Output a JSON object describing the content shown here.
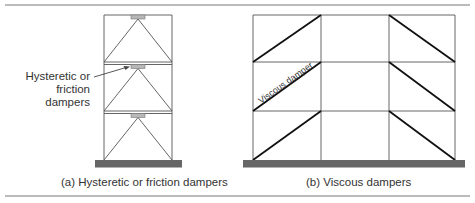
{
  "panels": [
    {
      "id": "a",
      "caption": "(a) Hysteretic or friction dampers",
      "annotation_line1": "Hysteretic or",
      "annotation_line2": "friction dampers",
      "stories": 3,
      "bays": 1,
      "bracing": "chevron",
      "damper_location": "top of chevron brace at each floor beam"
    },
    {
      "id": "b",
      "caption": "(b) Viscous dampers",
      "annotation": "Viscous damper",
      "stories": 3,
      "bays": 3,
      "bracing": "diagonal",
      "damper_location": "diagonals in outer bays"
    }
  ],
  "colors": {
    "frame": "#555555",
    "damper_fill": "#b8b8b8",
    "viscous_brace": "#111111",
    "ground_slab": "#666666",
    "rule": "#777777"
  }
}
